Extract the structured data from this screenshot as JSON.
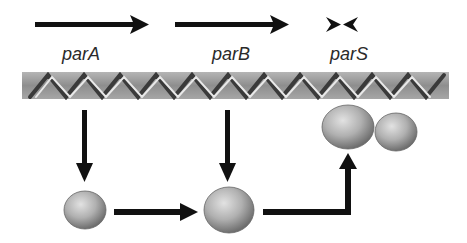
{
  "labels": {
    "gene_a": "parA",
    "gene_b": "parB",
    "site_s": "parS"
  },
  "elements": {
    "dna": "DNA double helix",
    "protein_a": "ParA protein",
    "protein_b": "ParB protein",
    "complex": "ParB bound to parS complex"
  },
  "colors": {
    "arrow": "#111111",
    "dna_band": "#9a9a9a",
    "protein": "#a8a8a8"
  }
}
